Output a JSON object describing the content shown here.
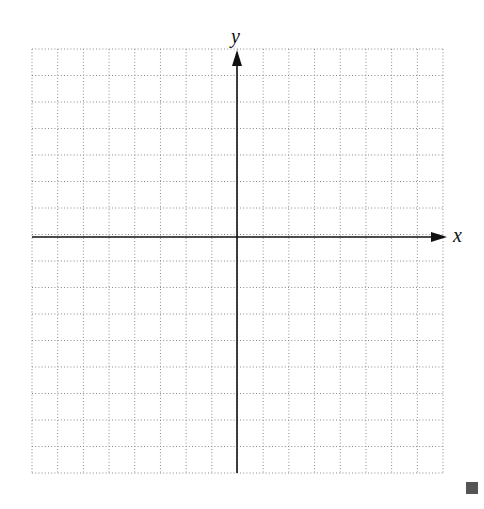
{
  "figure": {
    "type": "coordinate-plane",
    "axes": {
      "x_label": "x",
      "y_label": "y",
      "arrows": "positive-direction-only"
    },
    "grid": {
      "style": "dotted",
      "columns": 16,
      "rows": 16,
      "left": 32,
      "right": 443,
      "top": 49,
      "bottom": 473,
      "color": "#8a8a8a"
    },
    "origin_px": {
      "x": 237,
      "y": 237
    },
    "end_marker": "filled-square",
    "colors": {
      "axis": "#111111",
      "marker": "#555555"
    }
  }
}
